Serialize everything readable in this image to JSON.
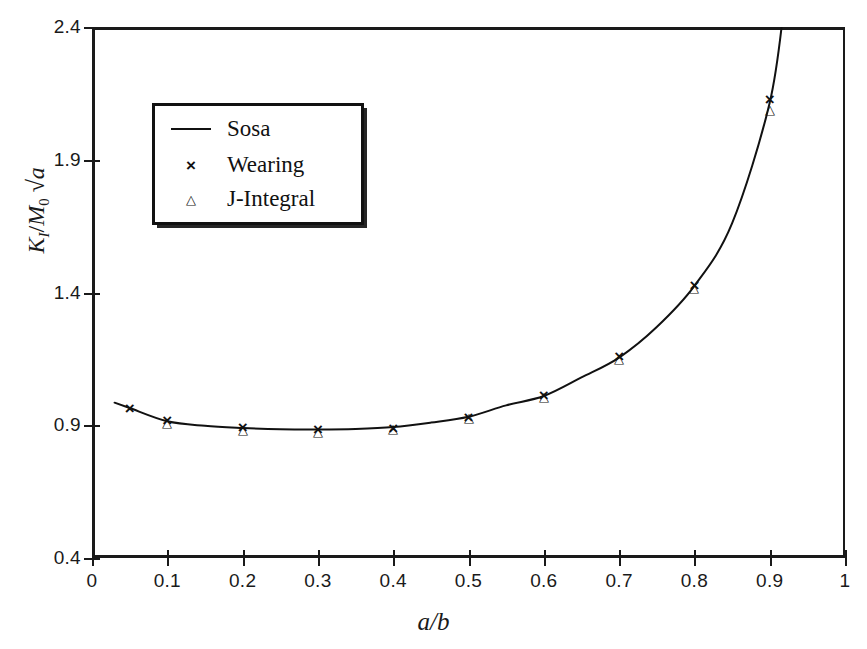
{
  "figure": {
    "background": "#ffffff",
    "ink_color": "#1a1a1a"
  },
  "axes": {
    "x": {
      "title": "a/b",
      "title_parts": {
        "num": "a",
        "slash": "/",
        "den": "b"
      },
      "min": 0,
      "max": 1,
      "tick_step": 0.1,
      "tick_labels": [
        "0",
        "0.1",
        "0.2",
        "0.3",
        "0.4",
        "0.5",
        "0.6",
        "0.7",
        "0.8",
        "0.9",
        "1"
      ],
      "tick_values": [
        0,
        0.1,
        0.2,
        0.3,
        0.4,
        0.5,
        0.6,
        0.7,
        0.8,
        0.9,
        1
      ]
    },
    "y": {
      "title": "K_I / M_0 √a",
      "title_parts": {
        "k": "K",
        "k_sub": "I",
        "slash": "/",
        "m": "M",
        "m_sub": "0",
        "radical": "√",
        "a": "a"
      },
      "min": 0.4,
      "max": 2.4,
      "tick_step": 0.5,
      "tick_labels": [
        "0.4",
        "0.9",
        "1.4",
        "1.9",
        "2.4"
      ],
      "tick_values": [
        0.4,
        0.9,
        1.4,
        1.9,
        2.4
      ]
    }
  },
  "legend": {
    "position": "inside-upper-left",
    "entries": [
      {
        "label": "Sosa",
        "marker": "line",
        "glyph": ""
      },
      {
        "label": "Wearing",
        "marker": "cross",
        "glyph": "×"
      },
      {
        "label": "J-Integral",
        "marker": "triangle",
        "glyph": "△"
      }
    ]
  },
  "chart_data": {
    "type": "line",
    "title": "",
    "xlabel": "a/b",
    "ylabel": "K_I / M_0 √a",
    "xlim": [
      0,
      1
    ],
    "ylim": [
      0.4,
      2.4
    ],
    "grid": false,
    "legend_position": "upper left inside",
    "series": [
      {
        "name": "Sosa",
        "type": "line",
        "marker": "none",
        "x": [
          0.03,
          0.05,
          0.1,
          0.15,
          0.2,
          0.25,
          0.3,
          0.35,
          0.4,
          0.45,
          0.5,
          0.55,
          0.6,
          0.65,
          0.7,
          0.75,
          0.8,
          0.85,
          0.9,
          0.92
        ],
        "y": [
          0.985,
          0.965,
          0.915,
          0.898,
          0.89,
          0.885,
          0.884,
          0.886,
          0.893,
          0.91,
          0.932,
          0.975,
          1.01,
          1.08,
          1.155,
          1.27,
          1.425,
          1.66,
          2.115,
          2.5
        ]
      },
      {
        "name": "Wearing",
        "type": "scatter",
        "marker": "×",
        "x": [
          0.05,
          0.1,
          0.2,
          0.3,
          0.4,
          0.5,
          0.6,
          0.7,
          0.8,
          0.9
        ],
        "y": [
          0.965,
          0.92,
          0.893,
          0.885,
          0.89,
          0.93,
          1.015,
          1.16,
          1.43,
          2.13
        ]
      },
      {
        "name": "J-Integral",
        "type": "scatter",
        "marker": "△",
        "x": [
          0.1,
          0.2,
          0.3,
          0.4,
          0.5,
          0.6,
          0.7,
          0.8,
          0.9
        ],
        "y": [
          0.912,
          0.885,
          0.88,
          0.888,
          0.932,
          1.01,
          1.155,
          1.42,
          2.09
        ]
      }
    ]
  }
}
